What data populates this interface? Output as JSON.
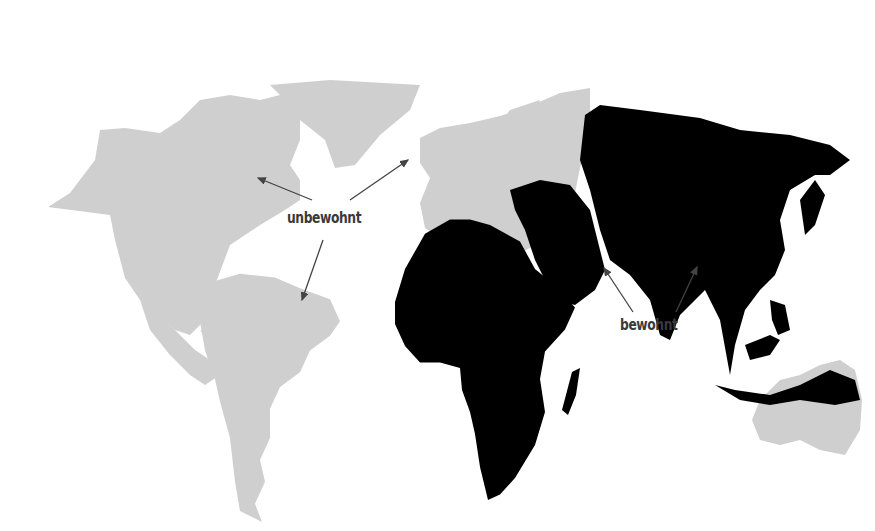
{
  "map": {
    "title": "",
    "colors": {
      "uninhabited": "#cfcfcf",
      "inhabited": "#000000",
      "arrow": "#444444",
      "background": "#ffffff"
    },
    "regions": [
      {
        "name": "North America",
        "status": "unbewohnt"
      },
      {
        "name": "Greenland",
        "status": "unbewohnt"
      },
      {
        "name": "South America",
        "status": "unbewohnt"
      },
      {
        "name": "Europe",
        "status": "unbewohnt"
      },
      {
        "name": "Australia",
        "status": "unbewohnt"
      },
      {
        "name": "Africa",
        "status": "bewohnt"
      },
      {
        "name": "Middle East",
        "status": "bewohnt"
      },
      {
        "name": "Asia",
        "status": "bewohnt"
      },
      {
        "name": "Southeast Asia",
        "status": "bewohnt"
      },
      {
        "name": "Madagascar",
        "status": "bewohnt"
      }
    ],
    "annotations": [
      {
        "label": "unbewohnt",
        "x": 287,
        "y": 209,
        "arrows_to": [
          "North America",
          "Europe",
          "South America"
        ]
      },
      {
        "label": "bewohnt",
        "x": 620,
        "y": 316,
        "arrows_to": [
          "Arabian Sea coast",
          "Southeast Asia"
        ]
      }
    ]
  }
}
